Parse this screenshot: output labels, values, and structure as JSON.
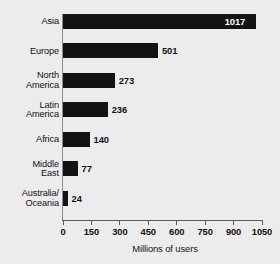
{
  "chart_data": {
    "type": "bar",
    "orientation": "horizontal",
    "title": "",
    "xlabel": "Millions of users",
    "ylabel": "",
    "xlim": [
      0,
      1050
    ],
    "xticks": [
      0,
      150,
      300,
      450,
      600,
      750,
      900,
      1050
    ],
    "xtick_labels": [
      "0",
      "150",
      "300",
      "450",
      "600",
      "750",
      "900",
      "1050"
    ],
    "grid": false,
    "legend": false,
    "categories": [
      "Asia",
      "Europe",
      "North\nAmerica",
      "Latin\nAmerica",
      "Africa",
      "Middle\nEast",
      "Australia/\nOceania"
    ],
    "values": [
      1017,
      501,
      273,
      236,
      140,
      77,
      24
    ],
    "value_labels": [
      "1017",
      "501",
      "273",
      "236",
      "140",
      "77",
      "24"
    ],
    "label_placement": [
      "inside",
      "outside",
      "outside",
      "outside",
      "outside",
      "outside",
      "outside"
    ],
    "colors": {
      "bar": "#131316",
      "background": "#ececed",
      "axis": "#58585a",
      "text": "#111113",
      "inside_label_text": "#ffffff"
    }
  }
}
